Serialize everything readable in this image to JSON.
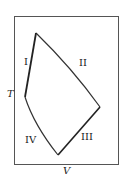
{
  "diagram": {
    "type": "T-V cycle diagram",
    "axes": {
      "y_label": "T",
      "x_label": "V"
    },
    "regions": [
      "I",
      "II",
      "III",
      "IV"
    ],
    "vertices": [
      {
        "name": "top",
        "x": 36,
        "y": 33
      },
      {
        "name": "right",
        "x": 100,
        "y": 107
      },
      {
        "name": "bottom",
        "x": 58,
        "y": 155
      },
      {
        "name": "left",
        "x": 25,
        "y": 97
      }
    ]
  }
}
